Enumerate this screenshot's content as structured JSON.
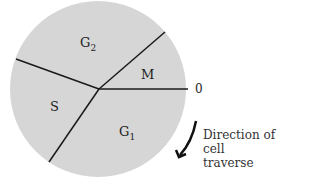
{
  "diagram": {
    "phases": [
      {
        "id": "G2",
        "label": "G",
        "sub": "2"
      },
      {
        "id": "M",
        "label": "M",
        "sub": ""
      },
      {
        "id": "S",
        "label": "S",
        "sub": ""
      },
      {
        "id": "G1",
        "label": "G",
        "sub": "1"
      }
    ],
    "zero_label": "0",
    "direction_line1": "Direction of",
    "direction_line2": "cell traverse",
    "colors": {
      "fill": "#d6d6d6",
      "line": "#1a1a1a"
    }
  }
}
